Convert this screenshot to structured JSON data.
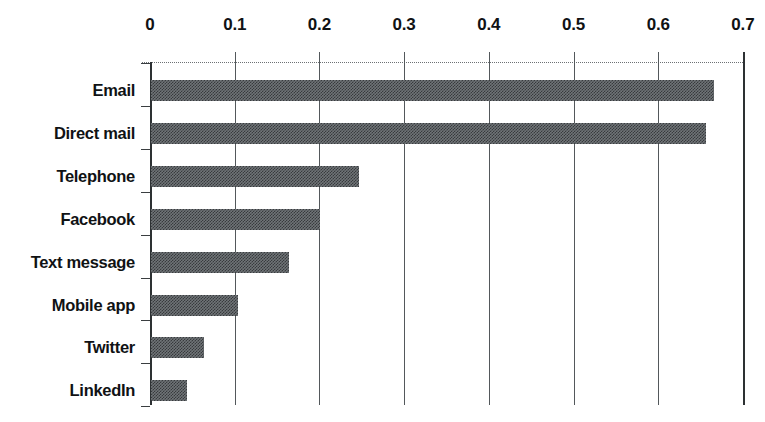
{
  "chart_data": {
    "type": "bar",
    "orientation": "horizontal",
    "title": "",
    "xlabel": "",
    "ylabel": "",
    "categories": [
      "Email",
      "Direct mail",
      "Telephone",
      "Facebook",
      "Text message",
      "Mobile app",
      "Twitter",
      "LinkedIn"
    ],
    "values": [
      0.665,
      0.655,
      0.245,
      0.2,
      0.163,
      0.103,
      0.063,
      0.043
    ],
    "xlim": [
      0,
      0.7
    ],
    "xticks": [
      0,
      0.1,
      0.2,
      0.3,
      0.4,
      0.5,
      0.6,
      0.7
    ],
    "xtick_labels": [
      "0",
      "0.1",
      "0.2",
      "0.3",
      "0.4",
      "0.5",
      "0.6",
      "0.7"
    ],
    "xaxis_position": "top",
    "grid": "vertical",
    "legend": "none",
    "bar_color": "#6f7477",
    "bar_fill": "halftone-gray-dither",
    "axis_color": "#2d3133",
    "text_color": "#101214"
  }
}
